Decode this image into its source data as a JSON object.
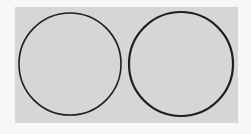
{
  "diagram": {
    "background_color": "#f7f7f7",
    "panel_color": "#d6d6d6",
    "stroke_color": "#1e1e1e",
    "shapes": [
      {
        "type": "circle",
        "label": "left-circle",
        "cx": 70,
        "cy": 64,
        "r": 51,
        "stroke_width": 1.6
      },
      {
        "type": "circle",
        "label": "right-circle",
        "cx": 181,
        "cy": 64,
        "r": 52,
        "stroke_width": 2.2
      }
    ]
  }
}
